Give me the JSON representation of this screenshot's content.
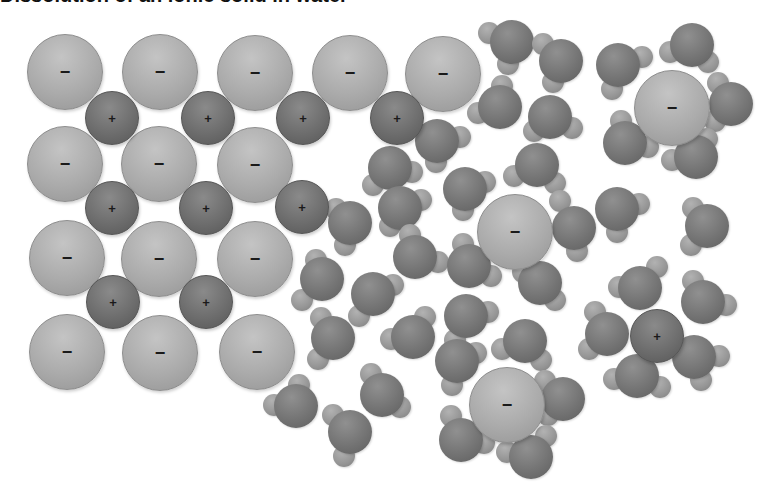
{
  "diagram": {
    "title_cropped": "Dissolution of an ionic solid in water",
    "colors": {
      "anion": "#ababab",
      "cation": "#6e6e6e",
      "oxygen": "#747474",
      "hydrogen": "#959595",
      "background": "#ffffff"
    },
    "labels": {
      "anion_sign": "−",
      "cation_sign": "+"
    },
    "anions": [
      {
        "x": 65,
        "y": 72,
        "r": 38
      },
      {
        "x": 160,
        "y": 72,
        "r": 38
      },
      {
        "x": 255,
        "y": 73,
        "r": 38
      },
      {
        "x": 350,
        "y": 73,
        "r": 38
      },
      {
        "x": 443,
        "y": 74,
        "r": 38
      },
      {
        "x": 65,
        "y": 164,
        "r": 38
      },
      {
        "x": 159,
        "y": 164,
        "r": 38
      },
      {
        "x": 255,
        "y": 165,
        "r": 38
      },
      {
        "x": 67,
        "y": 258,
        "r": 38
      },
      {
        "x": 159,
        "y": 259,
        "r": 38
      },
      {
        "x": 255,
        "y": 259,
        "r": 38
      },
      {
        "x": 67,
        "y": 352,
        "r": 38
      },
      {
        "x": 160,
        "y": 353,
        "r": 38
      },
      {
        "x": 257,
        "y": 352,
        "r": 38
      },
      {
        "x": 672,
        "y": 108,
        "r": 38
      },
      {
        "x": 515,
        "y": 232,
        "r": 38
      },
      {
        "x": 507,
        "y": 405,
        "r": 38
      }
    ],
    "cations": [
      {
        "x": 112,
        "y": 118,
        "r": 27
      },
      {
        "x": 208,
        "y": 118,
        "r": 27
      },
      {
        "x": 303,
        "y": 118,
        "r": 27
      },
      {
        "x": 397,
        "y": 118,
        "r": 27
      },
      {
        "x": 112,
        "y": 208,
        "r": 27
      },
      {
        "x": 206,
        "y": 208,
        "r": 27
      },
      {
        "x": 302,
        "y": 207,
        "r": 27
      },
      {
        "x": 113,
        "y": 302,
        "r": 27
      },
      {
        "x": 206,
        "y": 302,
        "r": 27
      },
      {
        "x": 657,
        "y": 336,
        "r": 27
      }
    ],
    "water_molecules": [
      {
        "o": [
          512,
          42
        ],
        "h": [
          [
            489,
            33
          ],
          [
            508,
            64
          ]
        ]
      },
      {
        "o": [
          561,
          61
        ],
        "h": [
          [
            543,
            44
          ],
          [
            553,
            82
          ]
        ]
      },
      {
        "o": [
          500,
          107
        ],
        "h": [
          [
            502,
            86
          ],
          [
            478,
            113
          ]
        ]
      },
      {
        "o": [
          550,
          117
        ],
        "h": [
          [
            534,
            131
          ],
          [
            572,
            128
          ]
        ]
      },
      {
        "o": [
          618,
          65
        ],
        "h": [
          [
            642,
            57
          ],
          [
            612,
            89
          ]
        ]
      },
      {
        "o": [
          692,
          45
        ],
        "h": [
          [
            670,
            52
          ],
          [
            708,
            62
          ]
        ]
      },
      {
        "o": [
          731,
          104
        ],
        "h": [
          [
            718,
            83
          ],
          [
            715,
            121
          ]
        ]
      },
      {
        "o": [
          625,
          143
        ],
        "h": [
          [
            621,
            121
          ],
          [
            648,
            147
          ]
        ]
      },
      {
        "o": [
          696,
          157
        ],
        "h": [
          [
            707,
            139
          ],
          [
            672,
            160
          ]
        ]
      },
      {
        "o": [
          437,
          141
        ],
        "h": [
          [
            460,
            137
          ],
          [
            436,
            162
          ]
        ]
      },
      {
        "o": [
          390,
          168
        ],
        "h": [
          [
            373,
            185
          ],
          [
            412,
            172
          ]
        ]
      },
      {
        "o": [
          537,
          165
        ],
        "h": [
          [
            514,
            176
          ],
          [
            555,
            183
          ]
        ]
      },
      {
        "o": [
          465,
          189
        ],
        "h": [
          [
            485,
            182
          ],
          [
            463,
            210
          ]
        ]
      },
      {
        "o": [
          400,
          208
        ],
        "h": [
          [
            390,
            226
          ],
          [
            421,
            200
          ]
        ]
      },
      {
        "o": [
          350,
          223
        ],
        "h": [
          [
            336,
            209
          ],
          [
            345,
            245
          ]
        ]
      },
      {
        "o": [
          574,
          228
        ],
        "h": [
          [
            560,
            201
          ],
          [
            577,
            251
          ]
        ]
      },
      {
        "o": [
          617,
          209
        ],
        "h": [
          [
            639,
            204
          ],
          [
            617,
            232
          ]
        ]
      },
      {
        "o": [
          707,
          226
        ],
        "h": [
          [
            693,
            208
          ],
          [
            691,
            245
          ]
        ]
      },
      {
        "o": [
          415,
          257
        ],
        "h": [
          [
            438,
            262
          ],
          [
            410,
            235
          ]
        ]
      },
      {
        "o": [
          469,
          266
        ],
        "h": [
          [
            463,
            244
          ],
          [
            491,
            276
          ]
        ]
      },
      {
        "o": [
          322,
          279
        ],
        "h": [
          [
            316,
            260
          ],
          [
            302,
            300
          ]
        ]
      },
      {
        "o": [
          373,
          294
        ],
        "h": [
          [
            359,
            316
          ],
          [
            393,
            285
          ]
        ]
      },
      {
        "o": [
          540,
          283
        ],
        "h": [
          [
            555,
            300
          ],
          [
            523,
            272
          ]
        ]
      },
      {
        "o": [
          640,
          288
        ],
        "h": [
          [
            619,
            287
          ],
          [
            657,
            267
          ]
        ]
      },
      {
        "o": [
          703,
          302
        ],
        "h": [
          [
            726,
            305
          ],
          [
            693,
            281
          ]
        ]
      },
      {
        "o": [
          466,
          316
        ],
        "h": [
          [
            455,
            340
          ],
          [
            488,
            312
          ]
        ]
      },
      {
        "o": [
          413,
          337
        ],
        "h": [
          [
            391,
            339
          ],
          [
            425,
            317
          ]
        ]
      },
      {
        "o": [
          333,
          338
        ],
        "h": [
          [
            321,
            318
          ],
          [
            318,
            359
          ]
        ]
      },
      {
        "o": [
          607,
          334
        ],
        "h": [
          [
            589,
            349
          ],
          [
            595,
            312
          ]
        ]
      },
      {
        "o": [
          694,
          357
        ],
        "h": [
          [
            719,
            356
          ],
          [
            701,
            380
          ]
        ]
      },
      {
        "o": [
          637,
          376
        ],
        "h": [
          [
            614,
            379
          ],
          [
            660,
            387
          ]
        ]
      },
      {
        "o": [
          457,
          361
        ],
        "h": [
          [
            452,
            385
          ],
          [
            476,
            353
          ]
        ]
      },
      {
        "o": [
          525,
          341
        ],
        "h": [
          [
            502,
            349
          ],
          [
            541,
            360
          ]
        ]
      },
      {
        "o": [
          382,
          395
        ],
        "h": [
          [
            371,
            374
          ],
          [
            400,
            407
          ]
        ]
      },
      {
        "o": [
          296,
          406
        ],
        "h": [
          [
            274,
            405
          ],
          [
            299,
            385
          ]
        ]
      },
      {
        "o": [
          563,
          399
        ],
        "h": [
          [
            545,
            381
          ],
          [
            548,
            415
          ]
        ]
      },
      {
        "o": [
          461,
          440
        ],
        "h": [
          [
            451,
            416
          ],
          [
            484,
            443
          ]
        ]
      },
      {
        "o": [
          531,
          457
        ],
        "h": [
          [
            507,
            452
          ],
          [
            546,
            436
          ]
        ]
      },
      {
        "o": [
          350,
          432
        ],
        "h": [
          [
            333,
            415
          ],
          [
            344,
            456
          ]
        ]
      }
    ]
  }
}
